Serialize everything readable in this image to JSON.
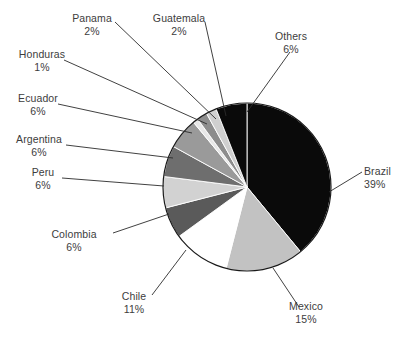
{
  "chart_data": {
    "type": "pie",
    "title": "",
    "subtitle": "",
    "xlabel": "",
    "ylabel": "",
    "legend_position": "none",
    "grid": false,
    "labels_show_percent": true,
    "start_angle_deg": 0,
    "direction": "clockwise",
    "categories": [
      "Brazil",
      "Mexico",
      "Chile",
      "Colombia",
      "Peru",
      "Argentina",
      "Ecuador",
      "Honduras",
      "Panama",
      "Guatemala",
      "Others"
    ],
    "values": [
      39,
      15,
      11,
      6,
      6,
      6,
      6,
      1,
      2,
      2,
      6
    ],
    "units": "%",
    "slices": [
      {
        "label": "Brazil",
        "percent_text": "39%",
        "value": 39,
        "color": "#0a0a0a"
      },
      {
        "label": "Mexico",
        "percent_text": "15%",
        "value": 15,
        "color": "#c2c2c2"
      },
      {
        "label": "Chile",
        "percent_text": "11%",
        "value": 11,
        "color": "#ffffff"
      },
      {
        "label": "Colombia",
        "percent_text": "6%",
        "value": 6,
        "color": "#5a5a5a"
      },
      {
        "label": "Peru",
        "percent_text": "6%",
        "value": 6,
        "color": "#d2d2d2"
      },
      {
        "label": "Argentina",
        "percent_text": "6%",
        "value": 6,
        "color": "#6e6e6e"
      },
      {
        "label": "Ecuador",
        "percent_text": "6%",
        "value": 6,
        "color": "#9a9a9a"
      },
      {
        "label": "Honduras",
        "percent_text": "1%",
        "value": 1,
        "color": "#e8e8e8"
      },
      {
        "label": "Panama",
        "percent_text": "2%",
        "value": 2,
        "color": "#8d8d8d"
      },
      {
        "label": "Guatemala",
        "percent_text": "2%",
        "value": 2,
        "color": "#cfcfcf"
      },
      {
        "label": "Others",
        "percent_text": "6%",
        "value": 6,
        "color": "#0a0a0a"
      }
    ]
  },
  "labels": {
    "brazil": {
      "name": "Brazil",
      "pct": "39%"
    },
    "mexico": {
      "name": "Mexico",
      "pct": "15%"
    },
    "chile": {
      "name": "Chile",
      "pct": "11%"
    },
    "colombia": {
      "name": "Colombia",
      "pct": "6%"
    },
    "peru": {
      "name": "Peru",
      "pct": "6%"
    },
    "argentina": {
      "name": "Argentina",
      "pct": "6%"
    },
    "ecuador": {
      "name": "Ecuador",
      "pct": "6%"
    },
    "honduras": {
      "name": "Honduras",
      "pct": "1%"
    },
    "panama": {
      "name": "Panama",
      "pct": "2%"
    },
    "guatemala": {
      "name": "Guatemala",
      "pct": "2%"
    },
    "others": {
      "name": "Others",
      "pct": "6%"
    }
  },
  "style": {
    "background": "#ffffff",
    "outline_color": "#1a1a1a",
    "leader_color": "#2b2b2b",
    "text_color": "#3d3d3d"
  },
  "geometry": {
    "center_x": 247,
    "center_y": 187,
    "radius": 84
  }
}
